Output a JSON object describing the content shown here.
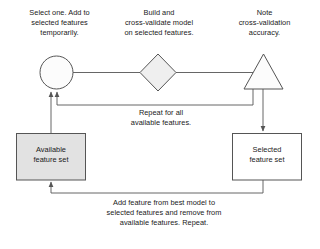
{
  "diagram": {
    "colors": {
      "stroke": "#555555",
      "text": "#1a1a1a",
      "box_fill_available": "#e2e2e2",
      "box_fill_selected": "#ffffff",
      "circle_fill": "#fcfcfc",
      "diamond_fill": "#efefef",
      "triangle_fill": "#fcfcfc"
    },
    "captions": {
      "select_step": "Select one. Add to\nselected features\ntemporarily.",
      "build_step": "Build and\ncross-validate model\non selected features.",
      "note_step": "Note\ncross-validation\naccuracy.",
      "repeat_loop": "Repeat for all\navailable features.",
      "add_loop": "Add feature from best model to\nselected features and remove from\navailable features. Repeat."
    },
    "nodes": {
      "circle": {
        "shape": "circle",
        "label": ""
      },
      "diamond": {
        "shape": "diamond",
        "label": ""
      },
      "triangle": {
        "shape": "triangle",
        "label": ""
      },
      "available_box": {
        "shape": "rectangle",
        "label": "Available\nfeature set"
      },
      "selected_box": {
        "shape": "rectangle",
        "label": "Selected\nfeature set"
      }
    },
    "edges": [
      {
        "from": "circle",
        "to": "diamond",
        "arrow": false
      },
      {
        "from": "diamond",
        "to": "triangle",
        "arrow": false
      },
      {
        "from": "triangle",
        "to": "circle",
        "arrow": true,
        "label": "Repeat for all available features."
      },
      {
        "from": "available_box",
        "to": "circle",
        "arrow": true
      },
      {
        "from": "triangle",
        "to": "selected_box",
        "arrow": true
      },
      {
        "from": "selected_box",
        "to": "available_box",
        "arrow": true,
        "label": "Add feature from best model to selected features and remove from available features. Repeat."
      }
    ]
  }
}
